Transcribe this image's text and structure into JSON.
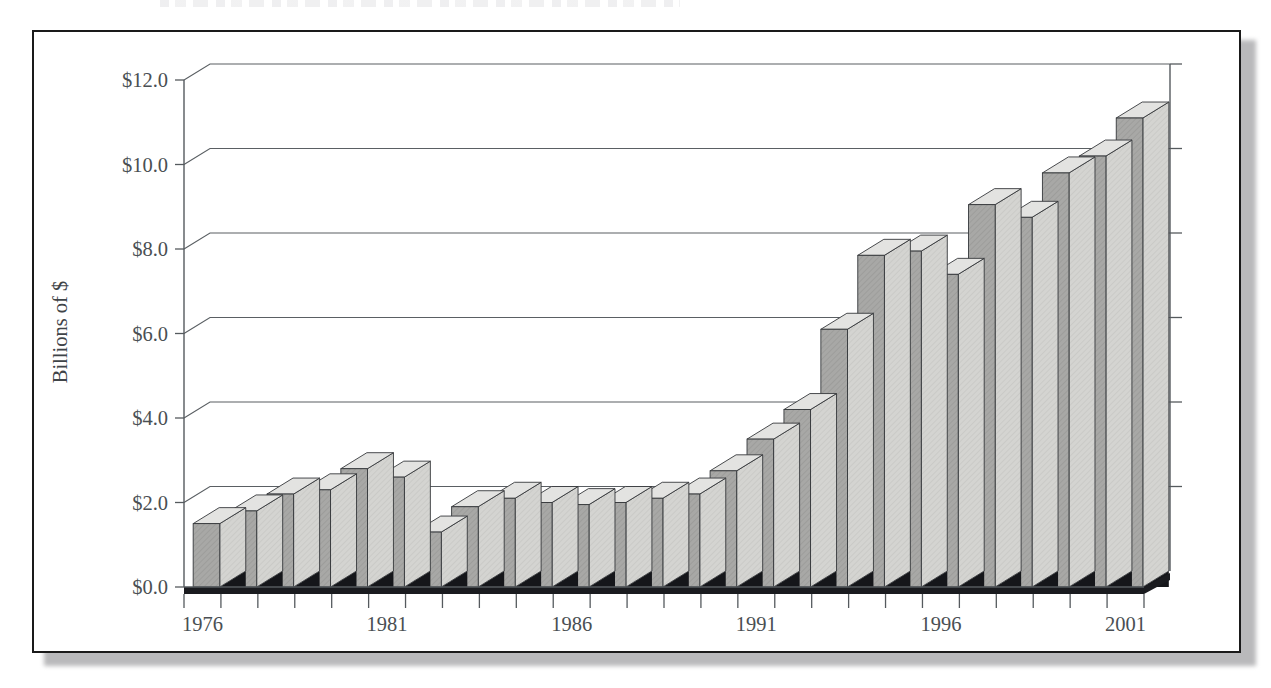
{
  "page": {
    "cut_off_header_sliver": "",
    "background_color": "#ffffff"
  },
  "figure": {
    "frame_border_color": "#1a1a1a",
    "shadow_color": "#b9b9bb"
  },
  "chart_data": {
    "type": "bar",
    "title": "",
    "xlabel": "",
    "ylabel": "Billions of $",
    "ylim": [
      0.0,
      12.0
    ],
    "ytick_labels": [
      "$0.0",
      "$2.0",
      "$4.0",
      "$6.0",
      "$8.0",
      "$10.0",
      "$12.0"
    ],
    "ytick_values": [
      0.0,
      2.0,
      4.0,
      6.0,
      8.0,
      10.0,
      12.0
    ],
    "grid": true,
    "grid_axis": "y",
    "legend": null,
    "legend_position": "none",
    "three_d": true,
    "bar_face_color": "#a9a9a7",
    "bar_top_color": "#e3e3e1",
    "bar_side_color": "#d2d2cf",
    "bar_edge_color": "#35383b",
    "xtick_labels_shown": [
      "1976",
      "1981",
      "1986",
      "1991",
      "1996",
      "2001"
    ],
    "categories": [
      "1976",
      "1977",
      "1978",
      "1979",
      "1980",
      "1981",
      "1982",
      "1983",
      "1984",
      "1985",
      "1986",
      "1987",
      "1988",
      "1989",
      "1990",
      "1991",
      "1992",
      "1993",
      "1994",
      "1995",
      "1996",
      "1997",
      "1998",
      "1999",
      "2000",
      "2001"
    ],
    "values": [
      1.5,
      1.8,
      2.2,
      2.3,
      2.8,
      2.6,
      1.3,
      1.9,
      2.1,
      2.0,
      1.95,
      2.0,
      2.1,
      2.2,
      2.75,
      3.5,
      4.2,
      6.1,
      7.85,
      7.95,
      7.4,
      9.05,
      8.75,
      9.8,
      10.2,
      11.1
    ]
  }
}
